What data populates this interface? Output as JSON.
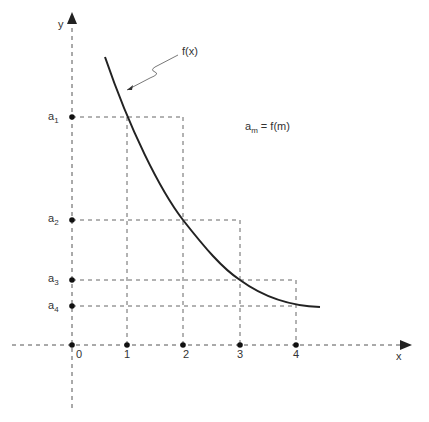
{
  "diagram": {
    "axes": {
      "x_label": "x",
      "y_label": "y",
      "x_ticks": [
        "0",
        "1",
        "2",
        "3",
        "4"
      ]
    },
    "y_markers": [
      {
        "base": "a",
        "sub": "1"
      },
      {
        "base": "a",
        "sub": "2"
      },
      {
        "base": "a",
        "sub": "3"
      },
      {
        "base": "a",
        "sub": "4"
      }
    ],
    "curve_label": "f(x)",
    "formula": {
      "lhs_base": "a",
      "lhs_sub": "m",
      "rhs": " = f(m)"
    },
    "colors": {
      "curve": "#222222",
      "dashed": "#666666",
      "text": "#333333"
    }
  }
}
